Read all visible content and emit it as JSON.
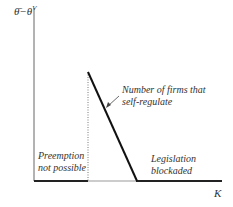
{
  "diagram": {
    "y_axis_label": "θ̄−θ",
    "y_axis_label_superscript": "V",
    "x_axis_label": "K",
    "curve_label_line1": "Number of firms that",
    "curve_label_line2": "self-regulate",
    "region_left_line1": "Preemption",
    "region_left_line2": "not possible",
    "region_right_line1": "Legislation",
    "region_right_line2": "blockaded",
    "colors": {
      "axis": "#555555",
      "line": "#222222",
      "text": "#333333"
    }
  }
}
